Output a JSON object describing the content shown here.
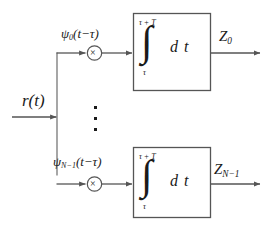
{
  "diagram": {
    "stroke_color": "#555555",
    "text_color": "#1a1a1a",
    "background": "#ffffff",
    "input": {
      "label": "r(t)",
      "name": "received-signal"
    },
    "branches": [
      {
        "id": "branch-0",
        "basis_label": "ψ₀(t−τ)",
        "basis_symbol": "ψ",
        "basis_subscript": "0",
        "basis_argument": "(t−τ)",
        "multiplier_glyph": "×",
        "integrator": {
          "symbol": "∫",
          "upper_limit": "τ + T",
          "lower_limit": "τ",
          "differential": "d t"
        },
        "output_label": "Z₀",
        "output_symbol": "Z",
        "output_subscript": "0"
      },
      {
        "id": "branch-n-minus-1",
        "basis_label": "ψ_{N−1}(t−τ)",
        "basis_symbol": "ψ",
        "basis_subscript": "N−1",
        "basis_argument": "(t−τ)",
        "multiplier_glyph": "×",
        "integrator": {
          "symbol": "∫",
          "upper_limit": "τ + T",
          "lower_limit": "τ",
          "differential": "d t"
        },
        "output_label": "Z_{N−1}",
        "output_symbol": "Z",
        "output_subscript": "N−1"
      }
    ],
    "ellipsis": {
      "orientation": "vertical",
      "dot_count": 3,
      "meaning": "additional branches omitted"
    }
  }
}
